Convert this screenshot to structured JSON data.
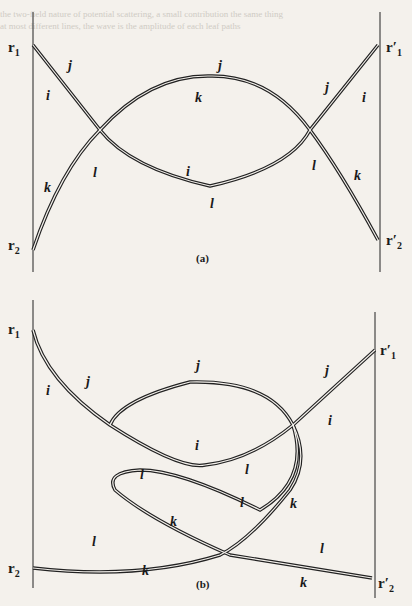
{
  "panels": [
    {
      "id": "a",
      "caption": "(a)",
      "endpoints": {
        "left_top": "r",
        "left_top_sub": "1",
        "left_bottom": "r",
        "left_bottom_sub": "2",
        "right_top": "r′",
        "right_top_sub": "1",
        "right_bottom": "r′",
        "right_bottom_sub": "2"
      },
      "labels": {
        "j_left": "j",
        "i_left": "i",
        "j_top": "j",
        "k_top": "k",
        "j_right": "j",
        "i_right": "i",
        "k_left": "k",
        "l_left": "l",
        "i_mid": "i",
        "l_mid": "l",
        "l_right": "l",
        "k_right": "k"
      }
    },
    {
      "id": "b",
      "caption": "(b)",
      "endpoints": {
        "left_top": "r",
        "left_top_sub": "1",
        "left_bottom": "r",
        "left_bottom_sub": "2",
        "right_top": "r′",
        "right_top_sub": "1",
        "right_bottom": "r′",
        "right_bottom_sub": "2"
      },
      "labels": {
        "j_left": "j",
        "i_left": "i",
        "j_top": "j",
        "j_right": "j",
        "i_right": "i",
        "i_mid": "i",
        "l_mid": "l",
        "l_loop": "l",
        "l_center": "l",
        "k_center": "k",
        "k_right_upper": "k",
        "l_lower_left": "l",
        "k_lower_left": "k",
        "l_lower_right": "l",
        "k_lower_right": "k"
      }
    }
  ]
}
